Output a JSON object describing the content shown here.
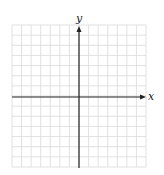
{
  "diagram": {
    "type": "coordinate-plane",
    "axes": {
      "x_label": "x",
      "y_label": "y"
    },
    "grid": {
      "columns": 14,
      "rows": 14,
      "line_color": "#d9d9d9",
      "axis_color": "#222222"
    }
  }
}
